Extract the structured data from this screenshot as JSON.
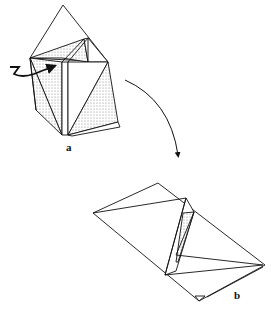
{
  "diagram": {
    "type": "origami-fold-sequence",
    "steps": [
      {
        "label": "a",
        "description": "Partially folded model with reverse-fold arrow on left flap"
      },
      {
        "label": "b",
        "description": "Resulting flattened model"
      }
    ],
    "arrows": [
      {
        "name": "turn-over-arrow",
        "from": "a",
        "to": "b"
      },
      {
        "name": "push-in-arrow",
        "step": "a"
      }
    ],
    "colors": {
      "line": "#111111",
      "shade": "#c8c8c8",
      "paper": "#ffffff"
    }
  }
}
